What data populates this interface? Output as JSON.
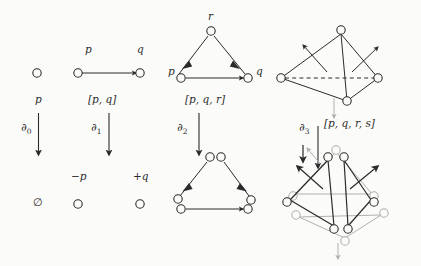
{
  "figure": {
    "background": "#fbfbfa",
    "ink": "#2b2b2b",
    "gray": "#b0b0b0"
  },
  "columns": [
    {
      "id": "point",
      "top_labels": [],
      "simplex_label": "p",
      "operator": "∂",
      "operator_sub": "0",
      "boundary_label": "∅",
      "boundary_vertex_labels": []
    },
    {
      "id": "edge",
      "top_labels": [
        "p",
        "q"
      ],
      "simplex_label": "[p, q]",
      "operator": "∂",
      "operator_sub": "1",
      "boundary_label": "",
      "boundary_vertex_labels": [
        "−p",
        "+q"
      ]
    },
    {
      "id": "triangle",
      "top_labels": [
        "p",
        "q",
        "r"
      ],
      "simplex_label": "[p, q, r]",
      "operator": "∂",
      "operator_sub": "2",
      "boundary_label": "",
      "boundary_vertex_labels": []
    },
    {
      "id": "tetrahedron",
      "top_labels": [],
      "simplex_label": "[p, q, r, s]",
      "operator": "∂",
      "operator_sub": "3",
      "boundary_label": "",
      "boundary_vertex_labels": []
    }
  ],
  "labels": {
    "p_point": "p",
    "p_edge_left": "p",
    "q_edge_right": "q",
    "p_tri_left": "p",
    "q_tri_right": "q",
    "r_tri_top": "r",
    "edge_simplex": "[p, q]",
    "tri_simplex": "[p, q, r]",
    "tet_simplex": "[p, q, r, s]",
    "point_simplex": "p",
    "empty_set": "∅",
    "minus_p": "−p",
    "plus_q": "+q",
    "d0": "∂",
    "d1": "∂",
    "d2": "∂",
    "d3": "∂",
    "d0_sub": "0",
    "d1_sub": "1",
    "d2_sub": "2",
    "d3_sub": "3"
  }
}
